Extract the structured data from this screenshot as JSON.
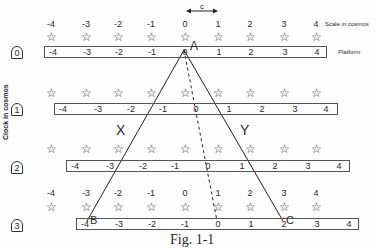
{
  "figure": {
    "caption": "Fig. 1-1",
    "scale_label": "Scale in cosmos",
    "platform_label": "Platform",
    "clock_axis_label": "Clock in cosmos",
    "c_label": "c",
    "region_left": "X",
    "region_right": "Y",
    "points": {
      "A": "A",
      "B": "B",
      "C": "C"
    }
  },
  "scale_ticks": [
    "-4",
    "-3",
    "-2",
    "-1",
    "0",
    "1",
    "2",
    "3",
    "4"
  ],
  "clocks": [
    "0",
    "1",
    "2",
    "3"
  ],
  "rows": [
    {
      "clock": "0",
      "show_scale": true,
      "platform_ticks": [
        "-4",
        "-3",
        "-2",
        "-1",
        "0",
        "1",
        "2",
        "3",
        "4"
      ]
    },
    {
      "clock": "1",
      "show_scale": false,
      "platform_ticks": [
        "-4",
        "-3",
        "-2",
        "-1",
        "0",
        "1",
        "2",
        "3",
        "4"
      ]
    },
    {
      "clock": "2",
      "show_scale": false,
      "platform_ticks": [
        "-4",
        "-3",
        "-2",
        "-1",
        "0",
        "1",
        "2",
        "3",
        "4"
      ]
    },
    {
      "clock": "3",
      "show_scale": true,
      "platform_ticks": [
        "-4",
        "-3",
        "-2",
        "-1",
        "0",
        "1",
        "2",
        "3",
        "4"
      ]
    }
  ]
}
